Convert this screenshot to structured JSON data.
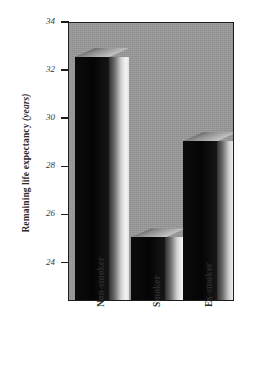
{
  "chart_data": {
    "type": "bar",
    "title": "",
    "subtitle": "",
    "xlabel": "",
    "ylabel": "Remaining life expectancy",
    "ylabel_unit": "(years)",
    "categories": [
      "Non-smoker",
      "Smoker",
      "Ex-smoker"
    ],
    "values": [
      32.5,
      25.0,
      29.0
    ],
    "ylim": [
      22.4,
      34
    ],
    "yticks": [
      34,
      32,
      30,
      28,
      26,
      24
    ],
    "ytick_labels": [
      "34",
      "32",
      "30",
      "28",
      "26",
      "24"
    ],
    "grid": false,
    "legend": null,
    "legend_position": "none",
    "series": [
      {
        "name": "Remaining life expectancy",
        "values": [
          32.5,
          25.0,
          29.0
        ]
      }
    ],
    "style": {
      "plot_background": "#9a9a9a",
      "bar_face_color": "#0a0a0a",
      "bar_highlight_color": "#f2f2f2",
      "axis_color": "#1c1c1c",
      "text_color": "#2b2b2b",
      "three_d": true
    }
  }
}
